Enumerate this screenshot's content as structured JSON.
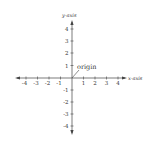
{
  "diagram": {
    "x_axis_label": "x-axis",
    "y_axis_label": "y-axis",
    "origin_label": "origin",
    "x_ticks": [
      "-4",
      "-3",
      "-2",
      "-1",
      "1",
      "2",
      "3",
      "4"
    ],
    "y_ticks": [
      "4",
      "3",
      "2",
      "1",
      "-1",
      "-2",
      "-3",
      "-4"
    ],
    "colors": {
      "axis": "#444444",
      "text": "#333333",
      "background": "#ffffff"
    }
  }
}
